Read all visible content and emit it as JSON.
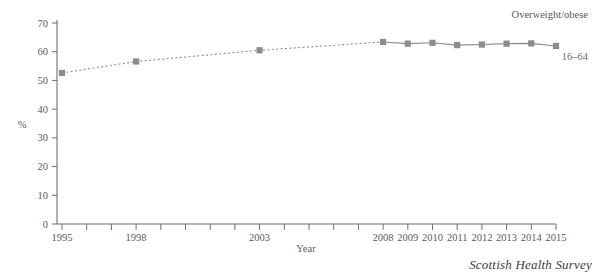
{
  "chart_data": {
    "type": "line",
    "title": "",
    "subtitle": "",
    "xlabel": "Year",
    "ylabel": "%",
    "ylim": [
      0,
      70
    ],
    "ytick_step": 10,
    "yticks": [
      "0",
      "10",
      "20",
      "30",
      "40",
      "50",
      "60",
      "70"
    ],
    "grid": false,
    "legend_position": "inline-right",
    "x": [
      1995,
      1998,
      2003,
      2008,
      2009,
      2010,
      2011,
      2012,
      2013,
      2014,
      2015
    ],
    "xticks_all": [
      1995,
      1996,
      1997,
      1998,
      1999,
      2000,
      2001,
      2002,
      2003,
      2004,
      2005,
      2006,
      2007,
      2008,
      2009,
      2010,
      2011,
      2012,
      2013,
      2014,
      2015
    ],
    "xtick_labels_shown": [
      "1995",
      "1998",
      "2003",
      "2008",
      "2009",
      "2010",
      "2011",
      "2012",
      "2013",
      "2014",
      "2015"
    ],
    "series": [
      {
        "name": "16-64",
        "annotation": "16–64",
        "group_annotation": "Overweight/obese",
        "color": "#8c8c8c",
        "marker": "square",
        "values": [
          52.6,
          56.6,
          60.5,
          63.4,
          62.8,
          63.1,
          62.3,
          62.5,
          62.8,
          62.9,
          62.0
        ]
      }
    ],
    "annotations": [
      {
        "text": "Overweight/obese",
        "x": 2014,
        "y": 69
      },
      {
        "text": "16–64",
        "x": 2015,
        "y": 58
      }
    ]
  },
  "axes": {
    "y_label": "%",
    "x_label": "Year",
    "y_ticks": [
      {
        "value": 70,
        "label": "70"
      },
      {
        "value": 60,
        "label": "60"
      },
      {
        "value": 50,
        "label": "50"
      },
      {
        "value": 40,
        "label": "40"
      },
      {
        "value": 30,
        "label": "30"
      },
      {
        "value": 20,
        "label": "20"
      },
      {
        "value": 10,
        "label": "10"
      },
      {
        "value": 0,
        "label": "0"
      }
    ],
    "x_ticks": [
      {
        "value": 1995,
        "label": "1995"
      },
      {
        "value": 1996,
        "label": ""
      },
      {
        "value": 1997,
        "label": ""
      },
      {
        "value": 1998,
        "label": "1998"
      },
      {
        "value": 1999,
        "label": ""
      },
      {
        "value": 2000,
        "label": ""
      },
      {
        "value": 2001,
        "label": ""
      },
      {
        "value": 2002,
        "label": ""
      },
      {
        "value": 2003,
        "label": "2003"
      },
      {
        "value": 2004,
        "label": ""
      },
      {
        "value": 2005,
        "label": ""
      },
      {
        "value": 2006,
        "label": ""
      },
      {
        "value": 2007,
        "label": ""
      },
      {
        "value": 2008,
        "label": "2008"
      },
      {
        "value": 2009,
        "label": "2009"
      },
      {
        "value": 2010,
        "label": "2010"
      },
      {
        "value": 2011,
        "label": "2011"
      },
      {
        "value": 2012,
        "label": "2012"
      },
      {
        "value": 2013,
        "label": "2013"
      },
      {
        "value": 2014,
        "label": "2014"
      },
      {
        "value": 2015,
        "label": "2015"
      }
    ]
  },
  "footer": {
    "source": "Scottish Health Survey"
  },
  "colors": {
    "series": "#8c8c8c",
    "axis": "#6f6f6f",
    "text": "#5a5a5a",
    "source_text": "#3d3d3d"
  }
}
